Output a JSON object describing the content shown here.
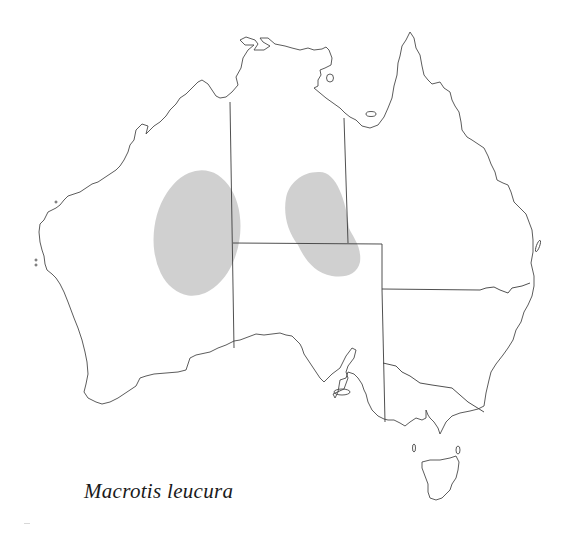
{
  "figure": {
    "species_label": "Macrotis leucura",
    "colors": {
      "background": "#ffffff",
      "coastline": "#4a4a4a",
      "state_borders": "#3c3c3c",
      "range_fill": "#cccccc"
    },
    "regions": [
      "WA",
      "NT",
      "SA",
      "QLD",
      "NSW",
      "VIC",
      "TAS"
    ],
    "distribution_areas": [
      {
        "name": "western-range",
        "description": "Oval area on WA/NT border (Gibson/Great Sandy desert region)"
      },
      {
        "name": "central-range",
        "description": "Kidney-shaped area in southern NT extending into NE SA"
      }
    ]
  }
}
